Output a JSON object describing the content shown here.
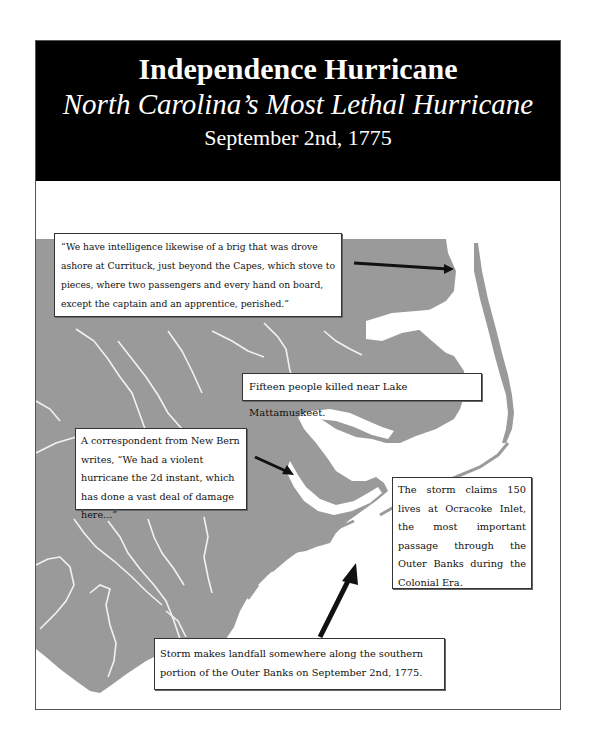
{
  "poster": {
    "title": "Independence Hurricane",
    "subtitle": "North Carolina’s Most Lethal Hurricane",
    "date": "September 2nd, 1775"
  },
  "colors": {
    "header_bg": "#000000",
    "header_text": "#ffffff",
    "land": "#9a9a9a",
    "water": "#ffffff",
    "lake": "#d9d9d9",
    "arrow": "#111111"
  },
  "map": {
    "region": "Eastern North Carolina coastline",
    "callouts": [
      {
        "id": "currituck",
        "text": "“We have intelligence likewise of a brig that was drove ashore at Currituck, just beyond the Capes, which stove to pieces, where two passengers and every hand on board, except the captain and an apprentice, perished.”"
      },
      {
        "id": "mattamuskeet",
        "text": "Fifteen people killed near Lake Mattamuskeet."
      },
      {
        "id": "new-bern",
        "text": "A correspondent from New Bern writes, “We had a violent hurricane the 2d instant, which has done a vast deal of damage here...”"
      },
      {
        "id": "ocracoke",
        "text": "The storm claims 150 lives at Ocracoke Inlet, the most important passage through the Outer Banks during the Colonial Era."
      },
      {
        "id": "landfall",
        "text": "Storm makes landfall somewhere along the southern portion of the Outer Banks on September 2nd, 1775."
      }
    ],
    "arrows": [
      {
        "from": "currituck-callout",
        "to": "Currituck Outer Banks"
      },
      {
        "from": "new-bern-callout",
        "to": "New Bern"
      },
      {
        "from": "landfall-callout",
        "to": "southern Outer Banks"
      }
    ]
  }
}
